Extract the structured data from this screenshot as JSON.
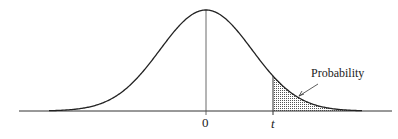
{
  "figure": {
    "type": "t-distribution-tail-diagram",
    "labels": {
      "zero": "0",
      "t": "t",
      "probability": "Probability"
    },
    "colors": {
      "curve": "#222222",
      "axis": "#333333",
      "shade": "#555555",
      "background": "#ffffff"
    },
    "geometry": {
      "baseline_y": 111,
      "axis_x_start": 19,
      "axis_x_end": 392,
      "center_x": 206,
      "peak_y": 10,
      "t_x": 273,
      "sigma_px": 46
    }
  }
}
